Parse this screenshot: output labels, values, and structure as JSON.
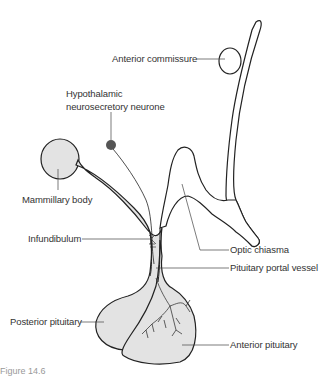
{
  "figure": {
    "caption_partial": "Figure 14.6"
  },
  "labels": {
    "anterior_commissure": "Anterior commissure",
    "hypothalamic_neurone_line1": "Hypothalamic",
    "hypothalamic_neurone_line2": "neurosecretory neurone",
    "mammillary_body": "Mammillary body",
    "infundibulum": "Infundibulum",
    "optic_chiasma": "Optic chiasma",
    "pituitary_portal_vessel": "Pituitary portal vessel",
    "posterior_pituitary": "Posterior pituitary",
    "anterior_pituitary": "Anterior pituitary"
  },
  "colors": {
    "outline": "#222222",
    "fill": "#e3e3e3",
    "neurone_body": "#555555",
    "leader": "#444444",
    "text": "#333333"
  }
}
